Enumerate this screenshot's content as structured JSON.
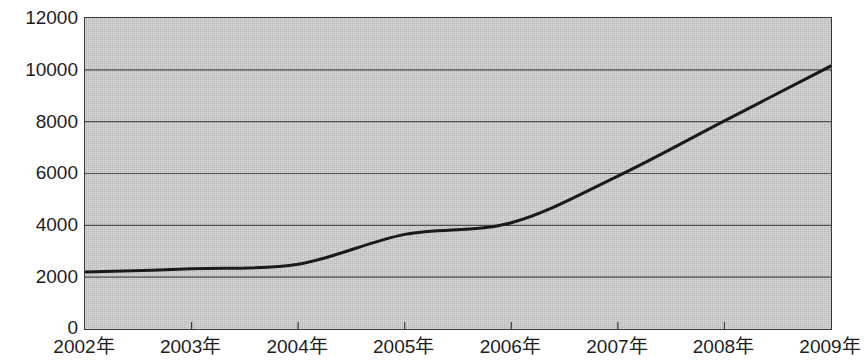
{
  "chart_data": {
    "type": "line",
    "title": "",
    "subtitle": "",
    "xlabel": "",
    "ylabel": "",
    "categories": [
      "2002年",
      "2003年",
      "2004年",
      "2005年",
      "2006年",
      "2007年",
      "2008年",
      "2009年"
    ],
    "series": [
      {
        "name": "",
        "values": [
          2200,
          2320,
          2500,
          3650,
          4100,
          5900,
          8030,
          10150
        ]
      }
    ],
    "ylim": [
      0,
      12000
    ],
    "y_ticks": [
      0,
      2000,
      4000,
      6000,
      8000,
      10000,
      12000
    ],
    "y_tick_labels": [
      "0",
      "2000",
      "4000",
      "6000",
      "8000",
      "10000",
      "12000"
    ],
    "x_tick_labels": [
      "2002年",
      "2003年",
      "2004年",
      "2005年",
      "2006年",
      "2007年",
      "2008年",
      "2009年"
    ],
    "grid": true,
    "grid_axis": "y",
    "legend": false,
    "legend_position": "none",
    "annotations": [],
    "colors": {
      "plot_background": "#c2c2c2",
      "page_background": "#ffffff",
      "line": "#1a1a1a",
      "grid": "#4a4a4a",
      "axis": "#3a3a3a",
      "text": "#1d1d1d"
    },
    "line_width": 3,
    "smoothing": "curved"
  }
}
